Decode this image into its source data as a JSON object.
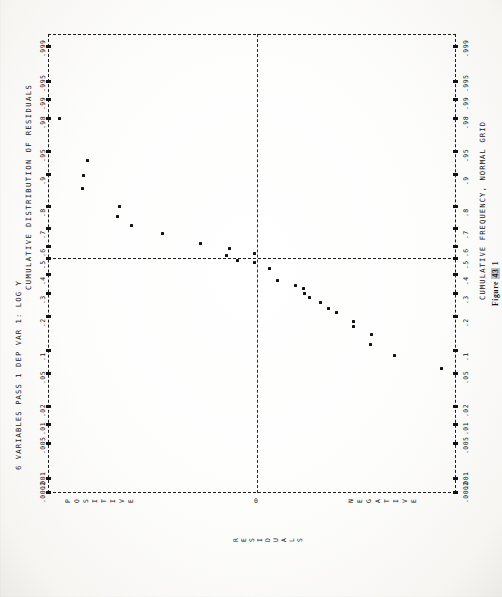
{
  "document": {
    "header": "6 VARIABLES PASS 1  DEP VAR 1: LOG Y",
    "left_axis_title": "CUMULATIVE DISTRIBUTION OF RESIDUALS",
    "right_axis_title": "CUMULATIVE FREQUENCY, NORMAL GRID",
    "figure_caption_prefix": "Figure ",
    "figure_caption_number": "43",
    "figure_caption_suffix": " 1",
    "residual_axis_label": "RESIDUALS",
    "positive_label": "POSITIVE",
    "negative_label": "NEGATIVE",
    "zero_label": "0"
  },
  "chart_data": {
    "type": "scatter",
    "title": "6 VARIABLES PASS 1  DEP VAR 1: LOG Y",
    "xlabel": "RESIDUALS",
    "ylabel": "CUMULATIVE DISTRIBUTION OF RESIDUALS",
    "ylabel_secondary": "CUMULATIVE FREQUENCY, NORMAL GRID",
    "orientation": "rotated-90-ccw",
    "grid": "normal-probability",
    "legend": "none",
    "ytick_labels": [
      ".999",
      ".995",
      ".99",
      ".98",
      ".95",
      ".9",
      ".8",
      ".7",
      ".6",
      ".5",
      ".4",
      ".3",
      ".2",
      ".1",
      ".05",
      ".02",
      ".01",
      ".005",
      ".001",
      ".0002"
    ],
    "ytick_values": [
      0.999,
      0.995,
      0.99,
      0.98,
      0.95,
      0.9,
      0.8,
      0.7,
      0.6,
      0.5,
      0.4,
      0.3,
      0.2,
      0.1,
      0.05,
      0.02,
      0.01,
      0.005,
      0.001,
      0.0002
    ],
    "ytick_pixel_offsets": [
      12,
      47,
      65,
      84,
      117,
      140,
      172,
      194,
      212,
      224,
      240,
      259,
      282,
      316,
      339,
      372,
      390,
      409,
      444,
      458
    ],
    "ylim_labels": [
      ".0002",
      ".999"
    ],
    "xlim_labels": [
      "POSITIVE",
      "NEGATIVE"
    ],
    "x_zero_pixel": 209,
    "x_annotations": [
      {
        "label": "POSITIVE",
        "side": "left"
      },
      {
        "label": "0",
        "side": "center"
      },
      {
        "label": "NEGATIVE",
        "side": "right"
      }
    ],
    "points": [
      {
        "x": 11,
        "y": 84
      },
      {
        "x": 39,
        "y": 126
      },
      {
        "x": 35,
        "y": 141
      },
      {
        "x": 34,
        "y": 154
      },
      {
        "x": 71,
        "y": 172
      },
      {
        "x": 69,
        "y": 182
      },
      {
        "x": 83,
        "y": 191
      },
      {
        "x": 114,
        "y": 199
      },
      {
        "x": 152,
        "y": 209
      },
      {
        "x": 181,
        "y": 214
      },
      {
        "x": 178,
        "y": 221
      },
      {
        "x": 189,
        "y": 226
      },
      {
        "x": 206,
        "y": 219
      },
      {
        "x": 206,
        "y": 228
      },
      {
        "x": 221,
        "y": 234
      },
      {
        "x": 229,
        "y": 246
      },
      {
        "x": 247,
        "y": 251
      },
      {
        "x": 255,
        "y": 254
      },
      {
        "x": 256,
        "y": 259
      },
      {
        "x": 261,
        "y": 263
      },
      {
        "x": 272,
        "y": 268
      },
      {
        "x": 280,
        "y": 274
      },
      {
        "x": 288,
        "y": 278
      },
      {
        "x": 305,
        "y": 287
      },
      {
        "x": 305,
        "y": 292
      },
      {
        "x": 323,
        "y": 300
      },
      {
        "x": 322,
        "y": 310
      },
      {
        "x": 346,
        "y": 321
      },
      {
        "x": 393,
        "y": 334
      }
    ],
    "n_points": 29
  }
}
